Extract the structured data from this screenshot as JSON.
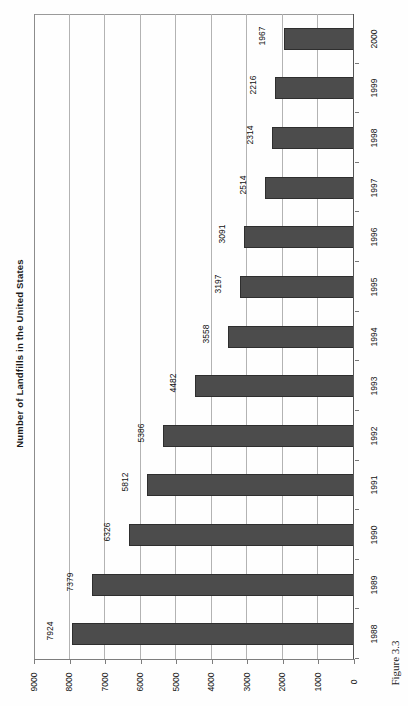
{
  "chart_data": {
    "type": "bar",
    "orientation": "horizontal",
    "title": "Number of Landfills in the United States",
    "xlabel": "",
    "ylabel": "",
    "categories": [
      "1988",
      "1989",
      "1990",
      "1991",
      "1992",
      "1993",
      "1994",
      "1995",
      "1996",
      "1997",
      "1998",
      "1999",
      "2000"
    ],
    "values": [
      7924,
      7379,
      6326,
      5812,
      5386,
      4482,
      3558,
      3197,
      3091,
      2514,
      2314,
      2216,
      1967
    ],
    "data_labels": [
      "7924",
      "7379",
      "6326",
      "5812",
      "5386",
      "4482",
      "3558",
      "3197",
      "3091",
      "2514",
      "2314",
      "2216",
      "1967"
    ],
    "value_axis_ticks": [
      9000,
      8000,
      7000,
      6000,
      5000,
      4000,
      3000,
      2000,
      1000,
      0
    ],
    "value_axis_tick_labels": [
      "9000",
      "8000",
      "7000",
      "6000",
      "5000",
      "4000",
      "3000",
      "2000",
      "1000",
      "0"
    ],
    "xlim": [
      0,
      9000
    ],
    "grid": true,
    "grid_axis": "value",
    "legend": false,
    "bar_color": "#4c4c4c",
    "bar_edge_color": "#2e2e2e",
    "gridline_color": "#b3b3b3",
    "axis_color": "#7d7d7d",
    "category_order": "bottom-to-top",
    "value_axis_direction": "right-to-left"
  },
  "caption": {
    "text": "Figure 3.3"
  }
}
